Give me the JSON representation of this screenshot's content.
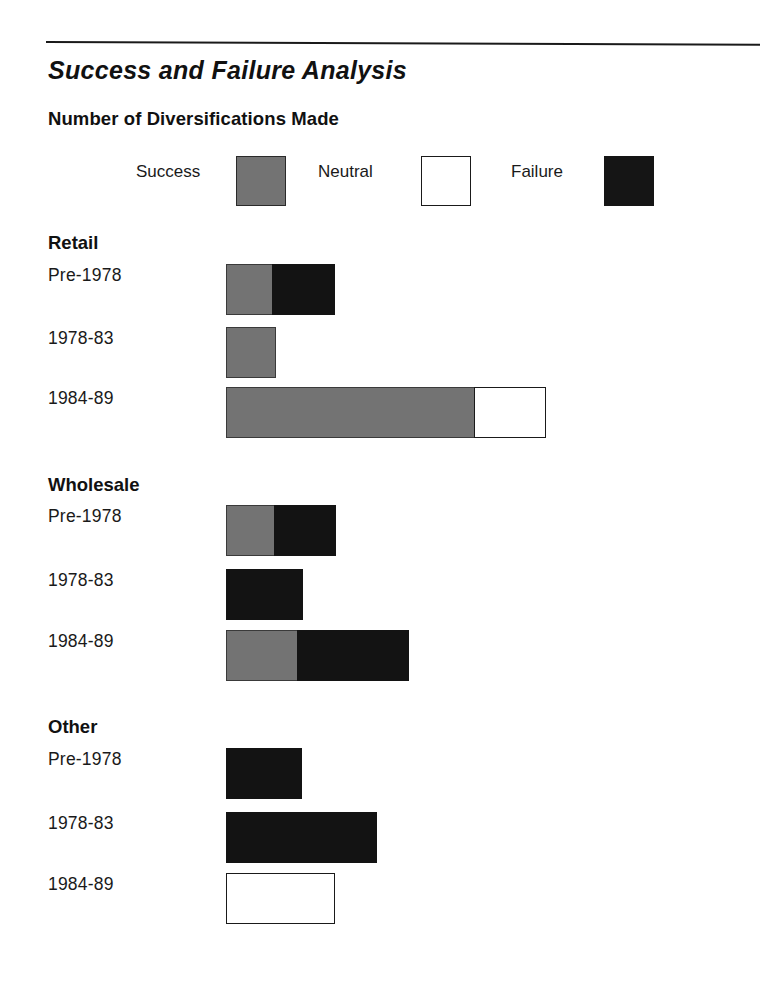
{
  "chart_data": {
    "type": "bar",
    "orientation": "horizontal",
    "stacked": true,
    "title": "Success and Failure Analysis",
    "subtitle": "Number of Diversifications Made",
    "xlabel": "",
    "ylabel": "",
    "grid": false,
    "legend_position": "top",
    "legend": [
      {
        "label": "Success",
        "color": "#737373",
        "swatch": "filled-gray"
      },
      {
        "label": "Neutral",
        "color": "#ffffff",
        "swatch": "outlined-white"
      },
      {
        "label": "Failure",
        "color": "#131313",
        "swatch": "filled-black"
      }
    ],
    "series": [
      {
        "name": "Success",
        "color": "#737373"
      },
      {
        "name": "Neutral",
        "color": "#ffffff"
      },
      {
        "name": "Failure",
        "color": "#131313"
      }
    ],
    "groups": [
      {
        "name": "Retail",
        "rows": [
          {
            "category": "Pre-1978",
            "success": 2,
            "neutral": 0,
            "failure": 3,
            "total": 5
          },
          {
            "category": "1978-83",
            "success": 2,
            "neutral": 0,
            "failure": 0,
            "total": 2
          },
          {
            "category": "1984-89",
            "success": 11,
            "neutral": 3,
            "failure": 0,
            "total": 14
          }
        ]
      },
      {
        "name": "Wholesale",
        "rows": [
          {
            "category": "Pre-1978",
            "success": 2,
            "neutral": 0,
            "failure": 3,
            "total": 5
          },
          {
            "category": "1978-83",
            "success": 0,
            "neutral": 0,
            "failure": 3,
            "total": 3
          },
          {
            "category": "1984-89",
            "success": 3,
            "neutral": 0,
            "failure": 5,
            "total": 8
          }
        ]
      },
      {
        "name": "Other",
        "rows": [
          {
            "category": "Pre-1978",
            "success": 0,
            "neutral": 0,
            "failure": 3,
            "total": 3
          },
          {
            "category": "1978-83",
            "success": 0,
            "neutral": 0,
            "failure": 7,
            "total": 7
          },
          {
            "category": "1984-89",
            "success": 0,
            "neutral": 5,
            "failure": 0,
            "total": 5
          }
        ]
      }
    ],
    "unit_px_per_count": 25,
    "bar_origin_x_px": 226
  },
  "layout": {
    "groups": [
      {
        "heading_top": 232,
        "rows": [
          {
            "label_top": 265,
            "bar_top": 264,
            "bar_left": 226,
            "segments": [
              {
                "kind": "success",
                "width": 47
              },
              {
                "kind": "failure",
                "width": 63
              }
            ]
          },
          {
            "label_top": 328,
            "bar_top": 327,
            "bar_left": 226,
            "segments": [
              {
                "kind": "success",
                "width": 50
              }
            ]
          },
          {
            "label_top": 388,
            "bar_top": 387,
            "bar_left": 226,
            "segments": [
              {
                "kind": "success",
                "width": 249
              },
              {
                "kind": "neutral",
                "width": 72
              }
            ]
          }
        ]
      },
      {
        "heading_top": 474,
        "rows": [
          {
            "label_top": 506,
            "bar_top": 505,
            "bar_left": 226,
            "segments": [
              {
                "kind": "success",
                "width": 49
              },
              {
                "kind": "failure",
                "width": 62
              }
            ]
          },
          {
            "label_top": 570,
            "bar_top": 569,
            "bar_left": 226,
            "segments": [
              {
                "kind": "failure",
                "width": 77
              }
            ]
          },
          {
            "label_top": 631,
            "bar_top": 630,
            "bar_left": 226,
            "segments": [
              {
                "kind": "success",
                "width": 72
              },
              {
                "kind": "failure",
                "width": 112
              }
            ]
          }
        ]
      },
      {
        "heading_top": 716,
        "rows": [
          {
            "label_top": 749,
            "bar_top": 748,
            "bar_left": 226,
            "segments": [
              {
                "kind": "failure",
                "width": 76
              }
            ]
          },
          {
            "label_top": 813,
            "bar_top": 812,
            "bar_left": 226,
            "segments": [
              {
                "kind": "failure",
                "width": 151
              }
            ]
          },
          {
            "label_top": 874,
            "bar_top": 873,
            "bar_left": 226,
            "segments": [
              {
                "kind": "neutral",
                "width": 109
              }
            ]
          }
        ]
      }
    ]
  }
}
